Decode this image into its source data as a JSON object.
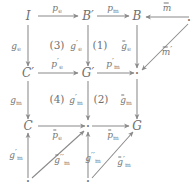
{
  "diagram": {
    "type": "commutative-diagram",
    "colors": {
      "ink": "#6f6f6f",
      "arrow": "#8a8a8a",
      "background": "#ffffff"
    },
    "nodes": [
      {
        "id": "I",
        "label": "I",
        "x": 28,
        "y": 16
      },
      {
        "id": "Bp",
        "label": "B′",
        "x": 88,
        "y": 16
      },
      {
        "id": "B",
        "label": "B",
        "x": 137,
        "y": 16
      },
      {
        "id": "dotTR",
        "label": "·",
        "x": 189,
        "y": 20
      },
      {
        "id": "Cp",
        "label": "C′",
        "x": 28,
        "y": 73
      },
      {
        "id": "Gp",
        "label": "G′",
        "x": 88,
        "y": 73
      },
      {
        "id": "dotMR",
        "label": "·",
        "x": 137,
        "y": 73
      },
      {
        "id": "C",
        "label": "C",
        "x": 28,
        "y": 126
      },
      {
        "id": "dotBM",
        "label": "·",
        "x": 88,
        "y": 126
      },
      {
        "id": "G",
        "label": "G",
        "x": 137,
        "y": 126
      },
      {
        "id": "dotB1",
        "label": "·",
        "x": 28,
        "y": 180
      },
      {
        "id": "dotB2",
        "label": "·",
        "x": 88,
        "y": 180
      }
    ],
    "edge_labels": {
      "p_e": {
        "base": "p",
        "sub": "e",
        "prime": "",
        "bar": false,
        "x": 57,
        "y": 8
      },
      "p_m": {
        "base": "p",
        "sub": "m",
        "prime": "",
        "bar": false,
        "x": 113,
        "y": 8
      },
      "m_bar": {
        "base": "m",
        "sub": "",
        "prime": "",
        "bar": true,
        "x": 167,
        "y": 8
      },
      "m_bar_pr": {
        "base": "m",
        "sub": "",
        "prime": "′",
        "bar": true,
        "x": 167,
        "y": 52
      },
      "g_e": {
        "base": "g",
        "sub": "e",
        "prime": "",
        "bar": false,
        "x": 16,
        "y": 46
      },
      "g_e_pr": {
        "base": "g",
        "sub": "e",
        "prime": "′",
        "bar": false,
        "x": 76,
        "y": 46
      },
      "g_e_bar": {
        "base": "g",
        "sub": "e",
        "prime": "",
        "bar": true,
        "x": 126,
        "y": 46
      },
      "p_e_pr": {
        "base": "p",
        "sub": "e",
        "prime": "′",
        "bar": false,
        "x": 57,
        "y": 64
      },
      "p_m_pr": {
        "base": "p",
        "sub": "m",
        "prime": "′",
        "bar": false,
        "x": 113,
        "y": 64
      },
      "g_m": {
        "base": "g",
        "sub": "m",
        "prime": "",
        "bar": false,
        "x": 16,
        "y": 100
      },
      "g_m_pr": {
        "base": "g",
        "sub": "m",
        "prime": "′",
        "bar": false,
        "x": 76,
        "y": 100
      },
      "g_m_bar": {
        "base": "g",
        "sub": "m",
        "prime": "",
        "bar": true,
        "x": 126,
        "y": 100
      },
      "p_e_bar": {
        "base": "p",
        "sub": "e",
        "prime": "",
        "bar": true,
        "x": 57,
        "y": 135
      },
      "p_m_bar": {
        "base": "p",
        "sub": "m",
        "prime": "",
        "bar": true,
        "x": 113,
        "y": 135
      },
      "g_m_pr2": {
        "base": "g",
        "sub": "m",
        "prime": "′",
        "bar": false,
        "x": 16,
        "y": 155
      },
      "g_m_bar2": {
        "base": "g",
        "sub": "m",
        "prime": "′′",
        "bar": true,
        "x": 62,
        "y": 160
      },
      "g_m_pr3": {
        "base": "g",
        "sub": "m",
        "prime": "′′",
        "bar": false,
        "x": 93,
        "y": 158
      },
      "g_m_bar3": {
        "base": "g",
        "sub": "m",
        "prime": "′",
        "bar": true,
        "x": 124,
        "y": 162
      }
    },
    "region_labels": [
      {
        "id": "r3",
        "label": "(3)",
        "x": 57,
        "y": 45
      },
      {
        "id": "r1",
        "label": "(1)",
        "x": 100,
        "y": 45
      },
      {
        "id": "r4",
        "label": "(4)",
        "x": 57,
        "y": 99
      },
      {
        "id": "r2",
        "label": "(2)",
        "x": 101,
        "y": 99
      }
    ]
  }
}
